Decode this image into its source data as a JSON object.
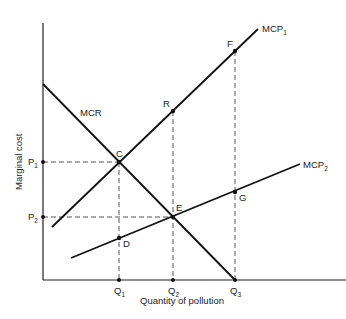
{
  "diagram": {
    "axes": {
      "y_label": "Marginal cost",
      "x_label": "Quantity of pollution",
      "origin": [
        43,
        280
      ],
      "y_top": 23,
      "x_right": 346
    },
    "curves": [
      {
        "id": "mcr",
        "label": "MCR",
        "label_pos": [
          80,
          116
        ],
        "from": [
          43,
          84
        ],
        "to": [
          235,
          280
        ]
      },
      {
        "id": "mcp1",
        "label": "MCP",
        "sub": "1",
        "label_pos": [
          262,
          32
        ],
        "from": [
          52,
          227
        ],
        "to": [
          258,
          29
        ]
      },
      {
        "id": "mcp2",
        "label": "MCP",
        "sub": "2",
        "label_pos": [
          303,
          168
        ],
        "from": [
          71,
          258
        ],
        "to": [
          300,
          164
        ]
      }
    ],
    "points": [
      {
        "id": "C",
        "label": "C",
        "x": 119,
        "y": 162,
        "label_dx": -3,
        "label_dy": -5
      },
      {
        "id": "R",
        "label": "R",
        "x": 173,
        "y": 111,
        "label_dx": -10,
        "label_dy": -4
      },
      {
        "id": "F",
        "label": "F",
        "x": 235,
        "y": 51,
        "label_dx": -8,
        "label_dy": -4
      },
      {
        "id": "D",
        "label": "D",
        "x": 119,
        "y": 238,
        "label_dx": 4,
        "label_dy": 9
      },
      {
        "id": "E",
        "label": "E",
        "x": 173,
        "y": 217,
        "label_dx": 3,
        "label_dy": -6
      },
      {
        "id": "G",
        "label": "G",
        "x": 235,
        "y": 192,
        "label_dx": 4,
        "label_dy": 9
      }
    ],
    "y_ticks": [
      {
        "label": "P",
        "sub": "1",
        "y": 162
      },
      {
        "label": "P",
        "sub": "2",
        "y": 217
      }
    ],
    "x_ticks": [
      {
        "label": "Q",
        "sub": "1",
        "x": 119
      },
      {
        "label": "Q",
        "sub": "2",
        "x": 173
      },
      {
        "label": "Q",
        "sub": "3",
        "x": 235
      }
    ]
  }
}
